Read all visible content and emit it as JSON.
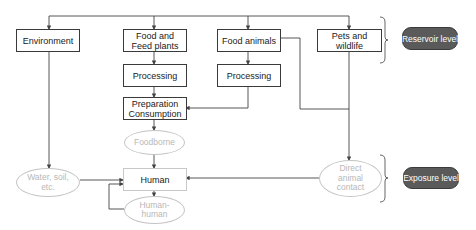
{
  "diagram": {
    "boxes": {
      "environment": "Environment",
      "food_feed_plants": "Food and\nFeed plants",
      "food_animals": "Food animals",
      "pets_wildlife": "Pets and wildlife",
      "processing_plants": "Processing",
      "processing_animals": "Processing",
      "preparation": "Preparation\nConsumption",
      "human": "Human"
    },
    "routes": {
      "foodborne": "Foodborne",
      "water_soil": "Water, soil,\netc.",
      "human_human": "Human-\nhuman",
      "direct_contact": "Direct\nanimal\ncontact"
    },
    "levels": {
      "reservoir": "Reservoir level",
      "exposure": "Exposure level"
    },
    "colors": {
      "box_border": "#3a3a3a",
      "route_border": "#c4c4c4",
      "route_text": "#b8b8b8",
      "badge_fill": "#5a5a5a",
      "badge_text": "#ffffff",
      "line": "#444444"
    }
  }
}
